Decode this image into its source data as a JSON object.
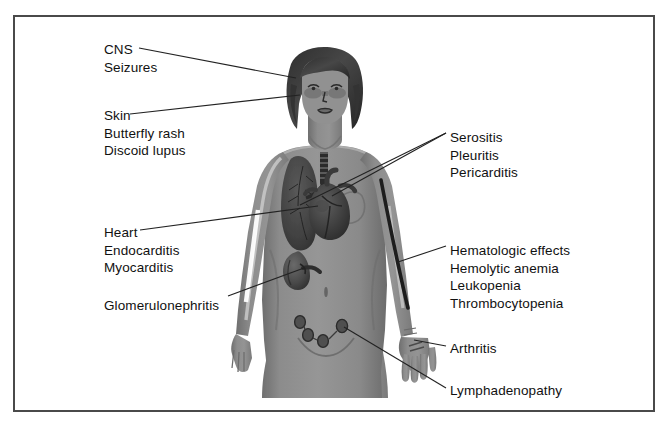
{
  "figure": {
    "border_color": "#4a4a4a",
    "background_color": "#ffffff",
    "skin_color": "#8a8a8a",
    "hair_color": "#3a3a3a",
    "organ_color": "#4d4d4d",
    "line_color": "#222222"
  },
  "labels": {
    "cns": {
      "name": "CNS",
      "lines": [
        "CNS",
        "Seizures"
      ],
      "x": 104,
      "y": 41
    },
    "skin": {
      "name": "Skin",
      "lines": [
        "Skin",
        "Butterfly rash",
        "Discoid lupus"
      ],
      "x": 104,
      "y": 107
    },
    "heart": {
      "name": "Heart",
      "lines": [
        "Heart",
        "Endocarditis",
        "Myocarditis"
      ],
      "x": 104,
      "y": 224
    },
    "glomerulonephritis": {
      "name": "Glomerulonephritis",
      "lines": [
        "Glomerulonephritis"
      ],
      "x": 104,
      "y": 297
    },
    "serositis": {
      "name": "Serositis",
      "lines": [
        "Serositis",
        "Pleuritis",
        "Pericarditis"
      ],
      "x": 450,
      "y": 129
    },
    "hematologic": {
      "name": "Hematologic effects",
      "lines": [
        "Hematologic effects",
        "Hemolytic anemia",
        "Leukopenia",
        "Thrombocytopenia"
      ],
      "x": 450,
      "y": 242
    },
    "arthritis": {
      "name": "Arthritis",
      "lines": [
        "Arthritis"
      ],
      "x": 450,
      "y": 342
    },
    "lymphadenopathy": {
      "name": "Lymphadenopathy",
      "lines": [
        "Lymphadenopathy"
      ],
      "x": 450,
      "y": 384
    }
  },
  "anatomy": {
    "parts": [
      "head",
      "hair",
      "face",
      "butterfly-rash",
      "neck",
      "torso",
      "left-arm",
      "right-arm",
      "left-hand",
      "right-hand",
      "lung",
      "heart",
      "trachea",
      "kidney",
      "lymph-nodes",
      "brachial-vessel",
      "navel",
      "thighs"
    ]
  }
}
